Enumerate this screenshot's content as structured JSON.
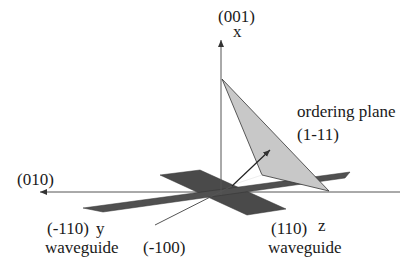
{
  "diagram": {
    "axes": {
      "vertical": {
        "direction_label": "(001)",
        "axis_label": "x"
      },
      "horizontal_left": {
        "direction_label": "(010)"
      },
      "diagonal": {
        "direction_label": "(-100)"
      }
    },
    "waveguides": [
      {
        "direction_label": "(-110)",
        "axis_label": "y",
        "name": "waveguide"
      },
      {
        "direction_label": "(110)",
        "axis_label": "z",
        "name": "waveguide"
      }
    ],
    "ordering_plane": {
      "label": "ordering plane",
      "miller": "(1-11)"
    },
    "colors": {
      "background": "#ffffff",
      "waveguide_fill": "#555555",
      "plane_fill": "#c8c8c8",
      "line": "#333333"
    }
  }
}
